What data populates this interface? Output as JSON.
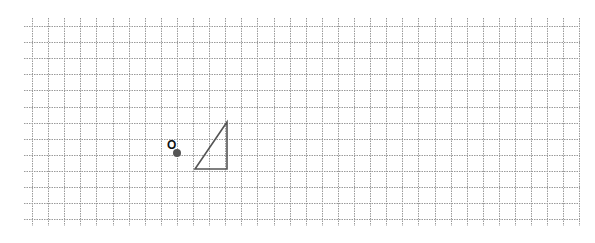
{
  "diagram": {
    "background": "#ffffff",
    "grid": {
      "cell_size": 16.1,
      "origin_x": 32,
      "origin_y": 26,
      "columns": 34,
      "rows": 12,
      "horizontal_line_x_start": 24,
      "horizontal_line_x_end": 580,
      "vertical_line_y_start": 18,
      "vertical_line_y_end": 226,
      "line_color": "#9a9a9a",
      "line_style": "dotted"
    },
    "point": {
      "label": "O",
      "x": 177,
      "y": 153,
      "radius": 4,
      "color": "#555555",
      "label_x": 167,
      "label_y": 149
    },
    "triangle": {
      "vertices": [
        [
          227,
          122
        ],
        [
          195,
          169
        ],
        [
          227,
          169
        ]
      ],
      "stroke": "#555555",
      "description": "right triangle with vertical leg and horizontal base meeting at bottom-right"
    }
  }
}
